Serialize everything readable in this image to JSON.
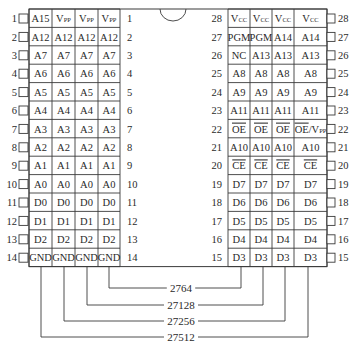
{
  "diagram": {
    "chip_variants": [
      "27512",
      "27256",
      "27128",
      "2764"
    ],
    "left_pins": [
      {
        "pin": 1,
        "names": [
          "A15",
          "VPP",
          "VPP",
          "VPP"
        ]
      },
      {
        "pin": 2,
        "names": [
          "A12",
          "A12",
          "A12",
          "A12"
        ]
      },
      {
        "pin": 3,
        "names": [
          "A7",
          "A7",
          "A7",
          "A7"
        ]
      },
      {
        "pin": 4,
        "names": [
          "A6",
          "A6",
          "A6",
          "A6"
        ]
      },
      {
        "pin": 5,
        "names": [
          "A5",
          "A5",
          "A5",
          "A5"
        ]
      },
      {
        "pin": 6,
        "names": [
          "A4",
          "A4",
          "A4",
          "A4"
        ]
      },
      {
        "pin": 7,
        "names": [
          "A3",
          "A3",
          "A3",
          "A3"
        ]
      },
      {
        "pin": 8,
        "names": [
          "A2",
          "A2",
          "A2",
          "A2"
        ]
      },
      {
        "pin": 9,
        "names": [
          "A1",
          "A1",
          "A1",
          "A1"
        ]
      },
      {
        "pin": 10,
        "names": [
          "A0",
          "A0",
          "A0",
          "A0"
        ]
      },
      {
        "pin": 11,
        "names": [
          "D0",
          "D0",
          "D0",
          "D0"
        ]
      },
      {
        "pin": 12,
        "names": [
          "D1",
          "D1",
          "D1",
          "D1"
        ]
      },
      {
        "pin": 13,
        "names": [
          "D2",
          "D2",
          "D2",
          "D2"
        ]
      },
      {
        "pin": 14,
        "names": [
          "GND",
          "GND",
          "GND",
          "GND"
        ]
      }
    ],
    "right_pins": [
      {
        "pin": 28,
        "names": [
          "VCC",
          "VCC",
          "VCC",
          "VCC"
        ]
      },
      {
        "pin": 27,
        "names": [
          "PGM",
          "PGM",
          "A14",
          "A14"
        ]
      },
      {
        "pin": 26,
        "names": [
          "NC",
          "A13",
          "A13",
          "A13"
        ]
      },
      {
        "pin": 25,
        "names": [
          "A8",
          "A8",
          "A8",
          "A8"
        ]
      },
      {
        "pin": 24,
        "names": [
          "A9",
          "A9",
          "A9",
          "A9"
        ]
      },
      {
        "pin": 23,
        "names": [
          "A11",
          "A11",
          "A11",
          "A11"
        ]
      },
      {
        "pin": 22,
        "names": [
          "OE",
          "OE",
          "OE",
          "OE/VPP"
        ]
      },
      {
        "pin": 21,
        "names": [
          "A10",
          "A10",
          "A10",
          "A10"
        ]
      },
      {
        "pin": 20,
        "names": [
          "CE",
          "CE",
          "CE",
          "CE"
        ]
      },
      {
        "pin": 19,
        "names": [
          "D7",
          "D7",
          "D7",
          "D7"
        ]
      },
      {
        "pin": 18,
        "names": [
          "D6",
          "D6",
          "D6",
          "D6"
        ]
      },
      {
        "pin": 17,
        "names": [
          "D5",
          "D5",
          "D5",
          "D5"
        ]
      },
      {
        "pin": 16,
        "names": [
          "D4",
          "D4",
          "D4",
          "D4"
        ]
      },
      {
        "pin": 15,
        "names": [
          "D3",
          "D3",
          "D3",
          "D3"
        ]
      }
    ],
    "overbar_signals": [
      "OE",
      "CE"
    ],
    "legend_labels": {
      "l1": "2764",
      "l2": "27128",
      "l3": "27256",
      "l4": "27512"
    }
  },
  "colors": {
    "line": "#3a3a3a",
    "text": "#2a2a2a",
    "background": "#ffffff"
  }
}
